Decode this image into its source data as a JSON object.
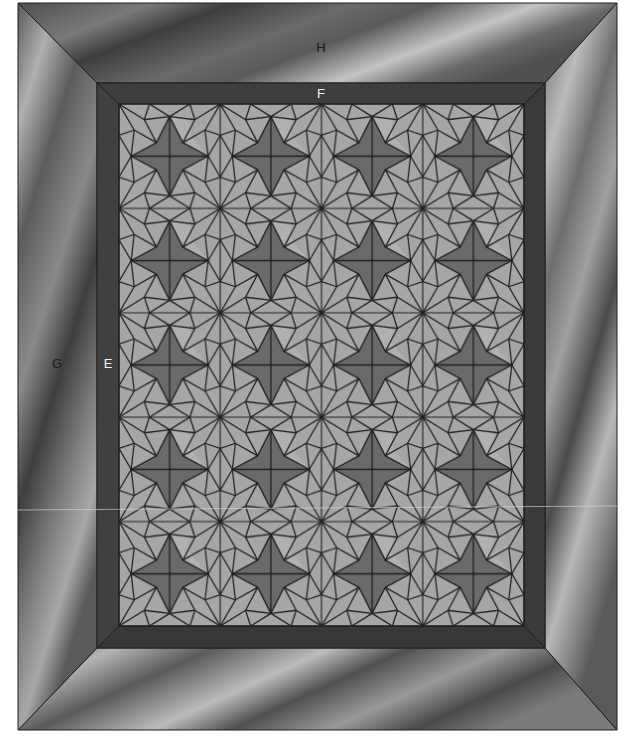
{
  "diagram": {
    "type": "quilt-layout",
    "grid": {
      "columns": 4,
      "rows": 5
    },
    "block_motif": "four-point-star",
    "labels": {
      "outer_border_top": "H",
      "inner_border_top": "F",
      "outer_border_left": "G",
      "inner_border_left": "E"
    },
    "colors": {
      "outer_border_dark": "#4a4a4a",
      "outer_border_light": "#b8b8b8",
      "inner_border": "#3c3c3c",
      "block_background": "#a6a6a6",
      "star_fill": "#6a6a6a",
      "line": "#1e1e1e"
    }
  }
}
